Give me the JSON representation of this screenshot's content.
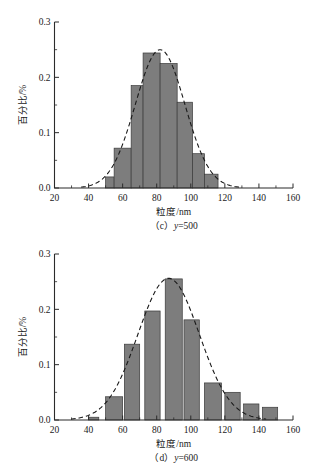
{
  "page": {
    "background": "#ffffff",
    "bar_color": "#7d7d7d",
    "bar_edge_color": "#3a3a3a",
    "axis_color": "#2b2b2b",
    "curve_color": "#1a1a1a"
  },
  "figures": [
    {
      "id": "figure-c",
      "caption_prefix": "（c）",
      "caption_var": "y",
      "caption_value": "=500",
      "caption_full": "（c）y=500",
      "xlabel": "粒度/nm",
      "ylabel": "百分比/%",
      "xticks": [
        "20",
        "40",
        "60",
        "80",
        "100",
        "120",
        "140",
        "160"
      ],
      "yticks": [
        "0.0",
        "0.1",
        "0.2",
        "0.3"
      ]
    },
    {
      "id": "figure-d",
      "caption_prefix": "（d）",
      "caption_var": "y",
      "caption_value": "=600",
      "caption_full": "（d）y=600",
      "xlabel": "粒度/nm",
      "ylabel": "百分比/%",
      "xticks": [
        "20",
        "40",
        "60",
        "80",
        "100",
        "120",
        "140",
        "160"
      ],
      "yticks": [
        "0.0",
        "0.1",
        "0.2",
        "0.3"
      ]
    }
  ],
  "chart_data": [
    {
      "type": "bar",
      "title": "（c）y=500",
      "xlabel": "粒度/nm",
      "ylabel": "百分比/%",
      "xlim": [
        20,
        160
      ],
      "ylim": [
        0.0,
        0.3
      ],
      "xticks": [
        20,
        40,
        60,
        80,
        100,
        120,
        140,
        160
      ],
      "yticks": [
        0.0,
        0.1,
        0.2,
        0.3
      ],
      "minor_xticks": [
        30,
        50,
        70,
        90,
        110,
        130,
        150
      ],
      "minor_yticks": [
        0.05,
        0.15,
        0.25
      ],
      "grid": false,
      "legend": null,
      "bin_width": 10,
      "bin_edges": [
        50,
        60,
        70,
        80,
        90,
        100,
        110,
        120
      ],
      "categories": [
        "50-60",
        "60-70",
        "70-80",
        "80-90",
        "90-100",
        "100-110",
        "110-120"
      ],
      "values": [
        0.02,
        0.072,
        0.185,
        0.244,
        0.225,
        0.155,
        0.062,
        0.025
      ],
      "bars": [
        {
          "x0": 50,
          "x1": 55,
          "height": 0.02
        },
        {
          "x0": 55,
          "x1": 65,
          "height": 0.072
        },
        {
          "x0": 65,
          "x1": 72,
          "height": 0.185
        },
        {
          "x0": 72,
          "x1": 82,
          "height": 0.244
        },
        {
          "x0": 82,
          "x1": 92,
          "height": 0.225
        },
        {
          "x0": 92,
          "x1": 101,
          "height": 0.155
        },
        {
          "x0": 101,
          "x1": 108,
          "height": 0.062
        },
        {
          "x0": 108,
          "x1": 116,
          "height": 0.025
        }
      ],
      "fit_curve": {
        "type": "gaussian",
        "peak_x": 82,
        "peak_y": 0.25,
        "sigma": 14.5,
        "style": "dashed"
      }
    },
    {
      "type": "bar",
      "title": "（d）y=600",
      "xlabel": "粒度/nm",
      "ylabel": "百分比/%",
      "xlim": [
        20,
        160
      ],
      "ylim": [
        0.0,
        0.3
      ],
      "xticks": [
        20,
        40,
        60,
        80,
        100,
        120,
        140,
        160
      ],
      "yticks": [
        0.0,
        0.1,
        0.2,
        0.3
      ],
      "minor_xticks": [
        30,
        50,
        70,
        90,
        110,
        130,
        150
      ],
      "minor_yticks": [
        0.05,
        0.15,
        0.25
      ],
      "grid": false,
      "legend": null,
      "bin_width": 10,
      "bin_edges": [
        40,
        50,
        60,
        70,
        80,
        90,
        100,
        110,
        120,
        130,
        140,
        150
      ],
      "categories": [
        "40-45",
        "50-60",
        "60-70",
        "73-82",
        "85-95",
        "95-105",
        "108-118",
        "120-128",
        "131-140",
        "142-150"
      ],
      "values": [
        0.005,
        0.042,
        0.137,
        0.197,
        0.255,
        0.181,
        0.067,
        0.05,
        0.029,
        0.023
      ],
      "bars": [
        {
          "x0": 40,
          "x1": 46,
          "height": 0.005
        },
        {
          "x0": 50,
          "x1": 60,
          "height": 0.042
        },
        {
          "x0": 61,
          "x1": 70,
          "height": 0.137
        },
        {
          "x0": 73,
          "x1": 82,
          "height": 0.197
        },
        {
          "x0": 85,
          "x1": 95,
          "height": 0.255
        },
        {
          "x0": 96,
          "x1": 105,
          "height": 0.181
        },
        {
          "x0": 108,
          "x1": 118,
          "height": 0.067
        },
        {
          "x0": 120,
          "x1": 129,
          "height": 0.05
        },
        {
          "x0": 131,
          "x1": 140,
          "height": 0.029
        },
        {
          "x0": 142,
          "x1": 151,
          "height": 0.023
        }
      ],
      "fit_curve": {
        "type": "gaussian",
        "peak_x": 87,
        "peak_y": 0.256,
        "sigma": 18.0,
        "style": "dashed"
      }
    }
  ]
}
